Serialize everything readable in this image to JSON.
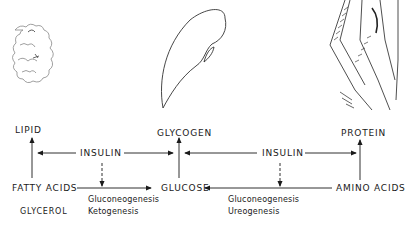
{
  "diagram": {
    "illustrations": [
      {
        "name": "adipose-tissue",
        "caption": "LIPID"
      },
      {
        "name": "liver",
        "caption": "GLYCOGEN"
      },
      {
        "name": "muscle",
        "caption": "PROTEIN"
      }
    ],
    "nodes": {
      "lipid": "LIPID",
      "glycogen": "GLYCOGEN",
      "protein": "PROTEIN",
      "fatty_acids": "FATTY ACIDS",
      "glycerol": "GLYCEROL",
      "glucose": "GLUCOSE",
      "amino_acids": "AMINO  ACIDS"
    },
    "regulators": {
      "insulin_left": "INSULIN",
      "insulin_right": "INSULIN"
    },
    "processes": {
      "left_1": "Gluconeogenesis",
      "left_2": "Ketogenesis",
      "right_1": "Gluconeogenesis",
      "right_2": "Ureogenesis"
    },
    "edges": [
      {
        "from": "fatty_acids",
        "to": "lipid",
        "style": "solid"
      },
      {
        "from": "insulin_left",
        "to": "lipid-arrow",
        "style": "solid"
      },
      {
        "from": "insulin_left",
        "to": "glycogen-arrow",
        "style": "solid"
      },
      {
        "from": "insulin_left",
        "to": "left-conversion",
        "style": "dashed"
      },
      {
        "from": "fatty_acids",
        "to": "glucose",
        "style": "solid"
      },
      {
        "from": "glucose",
        "to": "glycogen",
        "style": "solid"
      },
      {
        "from": "insulin_right",
        "to": "glycogen-arrow",
        "style": "solid"
      },
      {
        "from": "insulin_right",
        "to": "protein-arrow",
        "style": "solid"
      },
      {
        "from": "insulin_right",
        "to": "right-conversion",
        "style": "dashed"
      },
      {
        "from": "amino_acids",
        "to": "glucose",
        "style": "solid"
      },
      {
        "from": "amino_acids",
        "to": "protein",
        "style": "solid"
      }
    ]
  }
}
